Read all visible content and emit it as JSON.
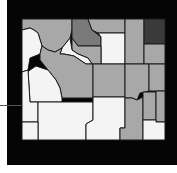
{
  "map": {
    "subject": "Wyoming counties choropleth",
    "colors": {
      "background": "#050505",
      "none": "#f4f4f4",
      "low": "#a8a8a8",
      "mid": "#7a7a7a",
      "high": "#3a3a3a"
    },
    "counties": [
      {
        "id": "park",
        "fill": "#a8a8a8",
        "points": "22,19 72,19 72,30 70,38 62,48 55,52 48,50 42,46 38,33 34,30 30,28 22,30"
      },
      {
        "id": "teton",
        "fill": "#f4f4f4",
        "points": "22,30 30,28 34,30 38,33 42,46 40,54 30,58 28,70 22,72"
      },
      {
        "id": "big-horn",
        "fill": "#7a7a7a",
        "points": "72,19 88,19 92,30 101,37 101,46 78,46 72,38"
      },
      {
        "id": "sheridan",
        "fill": "#a8a8a8",
        "points": "88,19 125,19 125,33 98,33 92,30"
      },
      {
        "id": "johnson",
        "fill": "#f4f4f4",
        "points": "98,33 125,33 125,64 101,64 101,46 101,37"
      },
      {
        "id": "crook",
        "fill": "#a8a8a8",
        "points": "125,19 144,19 144,64 125,64"
      },
      {
        "id": "weston-top",
        "fill": "#3a3a3a",
        "points": "144,19 165,19 165,44 144,44"
      },
      {
        "id": "weston",
        "fill": "#a8a8a8",
        "points": "144,44 165,44 165,64 144,64"
      },
      {
        "id": "washakie",
        "fill": "#a8a8a8",
        "points": "72,38 78,46 101,46 101,64 92,64 88,58 78,54 72,50"
      },
      {
        "id": "hot-springs",
        "fill": "#f4f4f4",
        "points": "62,48 70,38 72,50 78,54 88,58 92,64 86,64 74,56 64,54 60,54"
      },
      {
        "id": "fremont",
        "fill": "#a8a8a8",
        "points": "42,46 48,50 55,52 62,48 60,54 64,54 74,56 86,64 93,64 93,98 62,98 60,88 56,80 48,70 40,60 40,54"
      },
      {
        "id": "natrona",
        "fill": "#a8a8a8",
        "points": "93,64 125,64 125,97 93,97"
      },
      {
        "id": "converse",
        "fill": "#a8a8a8",
        "points": "125,64 149,64 149,91 140,93 137,100 132,98 125,98"
      },
      {
        "id": "niobrara",
        "fill": "#a8a8a8",
        "points": "149,64 165,64 165,91 149,91"
      },
      {
        "id": "sublette",
        "fill": "#f4f4f4",
        "points": "30,70 36,66 48,70 56,80 60,88 62,98 62,102 30,102 28,72"
      },
      {
        "id": "lincoln",
        "fill": "#f4f4f4",
        "points": "22,72 28,70 30,102 38,102 38,122 22,122"
      },
      {
        "id": "sweetwater",
        "fill": "#f4f4f4",
        "points": "38,102 93,102 93,120 86,124 86,140 38,140"
      },
      {
        "id": "carbon",
        "fill": "#f4f4f4",
        "points": "93,97 125,97 125,128 120,128 120,140 86,140 86,124 93,120"
      },
      {
        "id": "albany",
        "fill": "#a8a8a8",
        "points": "125,98 132,98 137,100 143,97 143,140 120,140 120,128 125,128"
      },
      {
        "id": "platte",
        "fill": "#a8a8a8",
        "points": "143,92 156,92 156,120 143,120"
      },
      {
        "id": "goshen",
        "fill": "#a8a8a8",
        "points": "156,91 165,91 165,122 156,122"
      },
      {
        "id": "laramie",
        "fill": "#f4f4f4",
        "points": "143,120 156,120 156,122 165,122 165,140 143,140"
      },
      {
        "id": "uinta",
        "fill": "#f4f4f4",
        "points": "22,122 38,122 38,140 22,140"
      }
    ]
  }
}
